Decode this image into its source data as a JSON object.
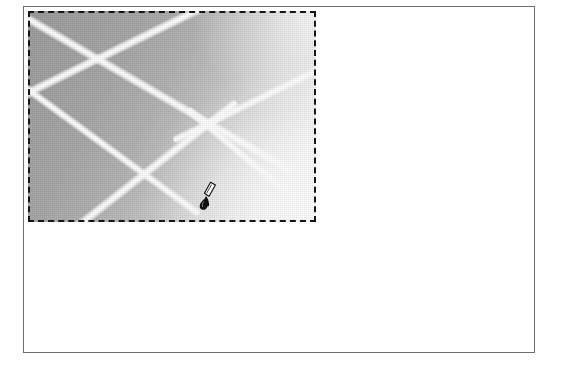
{
  "app": {
    "title": "Image Editor Canvas",
    "background_color": "#ffffff"
  },
  "canvas": {
    "name": "document-canvas",
    "border_color": "#6e6e72",
    "background_color": "#ffffff",
    "x": 23,
    "y": 6,
    "width": 512,
    "height": 347
  },
  "selection": {
    "label": "Rectangular marquee selection",
    "style": "marching-ants-dashed",
    "dash_color": "#151515",
    "x": 27,
    "y": 10,
    "width": 288,
    "height": 211
  },
  "image_content": {
    "description": "Grayscale gradient with soft white diagonal streak lines",
    "gradient_from": "#9d9d9d",
    "gradient_to": "#ffffff",
    "gradient_angle_deg": 118,
    "streak_color": "#ffffff",
    "streaks": [
      {
        "id": "streak-1",
        "angle_deg": -26,
        "length": 300,
        "offset_x": -54,
        "offset_y": -68,
        "width": 10
      },
      {
        "id": "streak-2",
        "angle_deg": -26,
        "length": 210,
        "offset_x": 96,
        "offset_y": -22,
        "width": 9
      },
      {
        "id": "streak-3",
        "angle_deg": 30,
        "length": 340,
        "offset_x": -26,
        "offset_y": -30,
        "width": 10
      },
      {
        "id": "streak-4",
        "angle_deg": 36,
        "length": 250,
        "offset_x": -74,
        "offset_y": 24,
        "width": 9
      },
      {
        "id": "streak-5",
        "angle_deg": -38,
        "length": 250,
        "offset_x": -34,
        "offset_y": 62,
        "width": 10
      },
      {
        "id": "streak-6",
        "angle_deg": 40,
        "length": 185,
        "offset_x": 86,
        "offset_y": 52,
        "width": 9
      }
    ]
  },
  "cursor": {
    "icon": "paintbrush-icon",
    "label": "Paintbrush tool cursor",
    "x": 196,
    "y": 180,
    "color": "#111111"
  }
}
